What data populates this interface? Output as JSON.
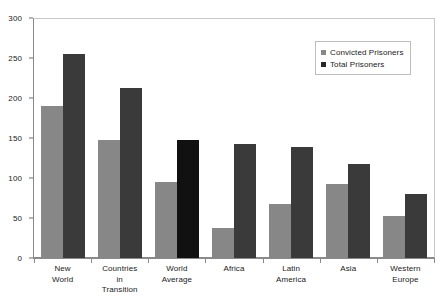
{
  "chart_data": {
    "type": "bar",
    "title": "",
    "xlabel": "",
    "ylabel": "",
    "ylim": [
      0,
      300
    ],
    "yticks": [
      0,
      50,
      100,
      150,
      200,
      250,
      300
    ],
    "grid": false,
    "legend_position": "top-right",
    "categories": [
      "New World",
      "Countries in Transition",
      "World Average",
      "Africa",
      "Latin America",
      "Asia",
      "Western Europe"
    ],
    "category_lines": [
      [
        "New",
        "World"
      ],
      [
        "Countries",
        "in",
        "Transition"
      ],
      [
        "World",
        "Average"
      ],
      [
        "Africa"
      ],
      [
        "Latin",
        "America"
      ],
      [
        "Asia"
      ],
      [
        "Western",
        "Europe"
      ]
    ],
    "series": [
      {
        "name": "Convicted Prisoners",
        "color": "#878787",
        "values": [
          190,
          147,
          95,
          37,
          67,
          93,
          53
        ]
      },
      {
        "name": "Total Prisoners",
        "color": "#3a3a3a",
        "values": [
          255,
          213,
          147,
          142,
          139,
          118,
          80
        ],
        "emphasis_index": 2,
        "emphasis_color": "#111111"
      }
    ]
  },
  "legend": {
    "items": [
      {
        "label": "Convicted Prisoners",
        "swatch": "convicted"
      },
      {
        "label": "Total Prisoners",
        "swatch": "total"
      }
    ]
  },
  "colors": {
    "convicted": "#878787",
    "total": "#3a3a3a",
    "total_emphasis": "#111111",
    "axis": "#8a8a8a",
    "frame": "#c8c8c8",
    "text": "#1a1a1a",
    "background": "#ffffff"
  }
}
